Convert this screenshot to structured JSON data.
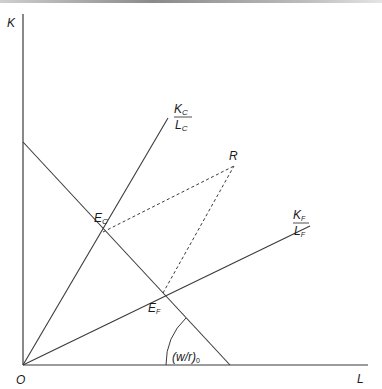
{
  "diagram": {
    "axes": {
      "y_label": "K",
      "x_label": "L",
      "origin_label": "O"
    },
    "rays": [
      {
        "name": "capital-intensive-ray",
        "num_main": "K",
        "num_sub": "C",
        "den_main": "L",
        "den_sub": "C"
      },
      {
        "name": "labor-intensive-ray",
        "num_main": "K",
        "num_sub": "F",
        "den_main": "L",
        "den_sub": "F"
      }
    ],
    "points": {
      "ec": {
        "main": "E",
        "sub": "C"
      },
      "ef": {
        "main": "E",
        "sub": "F"
      },
      "r": {
        "main": "R"
      }
    },
    "angle_label": {
      "main": "(w/r)",
      "sub": "0"
    },
    "colors": {
      "line": "#3a3a3a",
      "text": "#1a1a1a",
      "background": "#ffffff"
    }
  }
}
